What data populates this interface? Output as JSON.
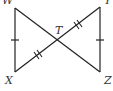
{
  "diagram": {
    "type": "geometry",
    "points": {
      "W": {
        "label": "W",
        "x": 15,
        "y": 8
      },
      "Y": {
        "label": "Y",
        "x": 100,
        "y": 7
      },
      "X": {
        "label": "X",
        "x": 15,
        "y": 72
      },
      "Z": {
        "label": "Z",
        "x": 100,
        "y": 72
      },
      "T": {
        "label": "T",
        "x": 58,
        "y": 40
      }
    },
    "segments": [
      "WX",
      "YZ",
      "WZ",
      "XY"
    ],
    "congruence_marks": [
      {
        "segments": [
          "WX",
          "YZ"
        ],
        "ticks": 1
      },
      {
        "segments": [
          "XT",
          "TY"
        ],
        "ticks": 2
      }
    ],
    "colors": {
      "line": "#222222",
      "label": "#333333"
    }
  }
}
